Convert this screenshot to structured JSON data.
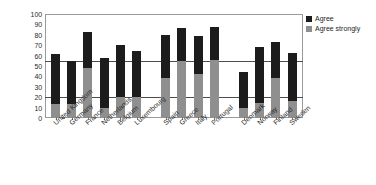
{
  "chart_data": {
    "type": "bar",
    "subtype": "stacked",
    "title": "",
    "xlabel": "",
    "ylabel": "",
    "ylim": [
      0,
      100
    ],
    "ytick_step": 10,
    "yticks": [
      100,
      90,
      80,
      70,
      60,
      50,
      40,
      30,
      20,
      10,
      0
    ],
    "grid": true,
    "gridlines": [
      20,
      55
    ],
    "legend_position": "top-right",
    "categories": [
      "United Kingdom",
      "Germany",
      "France",
      "Netherlands",
      "Belgium",
      "Luxembourg",
      "Spain",
      "Greece",
      "Italy",
      "Portugal",
      "Denmark",
      "Norway",
      "Finland",
      "Sweden"
    ],
    "group_breaks_after": [
      "Luxembourg",
      "Portugal"
    ],
    "series": [
      {
        "name": "Agree strongly",
        "color": "#8f8f8f",
        "values": [
          13,
          13,
          48,
          10,
          20,
          20,
          38,
          55,
          42,
          56,
          10,
          14,
          38,
          16
        ]
      },
      {
        "name": "Agree",
        "color": "#1c1c1c",
        "values": [
          49,
          42,
          35,
          48,
          50,
          44,
          42,
          32,
          37,
          32,
          34,
          54,
          35,
          47
        ]
      }
    ],
    "totals": [
      62,
      55,
      83,
      58,
      70,
      64,
      80,
      87,
      79,
      88,
      44,
      68,
      73,
      63
    ]
  },
  "legend": {
    "items": [
      {
        "label": "Agree",
        "color": "#1c1c1c"
      },
      {
        "label": "Agree strongly",
        "color": "#8f8f8f"
      }
    ]
  }
}
